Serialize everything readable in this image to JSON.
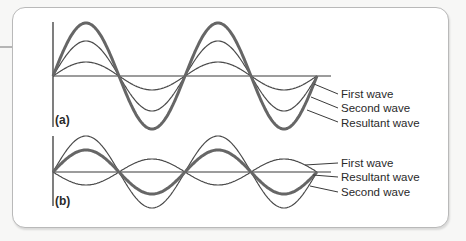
{
  "diagram": {
    "colors": {
      "axis": "#3a3a3a",
      "thin_wave": "#4a4a4a",
      "resultant_wave": "#6a6a6a",
      "frame": "#b9b9b9"
    },
    "panels": [
      {
        "id": "a",
        "label": "(a)",
        "type": "constructive",
        "baseline_y": 76,
        "x_start": 53,
        "half_period_px": 66,
        "half_periods": 4,
        "waves": [
          {
            "name": "first",
            "label": "First wave",
            "amplitude": 14,
            "phase": 1
          },
          {
            "name": "second",
            "label": "Second wave",
            "amplitude": 35,
            "phase": 1
          },
          {
            "name": "resultant",
            "label": "Resultant wave",
            "amplitude": 53,
            "phase": 1
          }
        ],
        "legend_order": [
          "First wave",
          "Second wave",
          "Resultant wave"
        ]
      },
      {
        "id": "b",
        "label": "(b)",
        "type": "destructive",
        "baseline_y": 172,
        "x_start": 53,
        "half_period_px": 66,
        "half_periods": 4,
        "waves": [
          {
            "name": "first",
            "label": "First wave",
            "amplitude": 13,
            "phase": -1
          },
          {
            "name": "second",
            "label": "Second wave",
            "amplitude": 36,
            "phase": 1
          },
          {
            "name": "resultant",
            "label": "Resultant wave",
            "amplitude": 22,
            "phase": 1
          }
        ],
        "legend_order": [
          "First wave",
          "Resultant wave",
          "Second wave"
        ]
      }
    ]
  }
}
